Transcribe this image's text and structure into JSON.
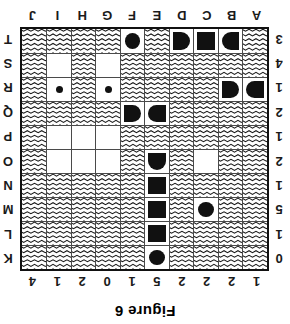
{
  "caption": "Figure 6",
  "grid": {
    "size": 10,
    "column_labels": [
      "A",
      "B",
      "C",
      "D",
      "E",
      "F",
      "G",
      "H",
      "I",
      "J"
    ],
    "row_labels": [
      "K",
      "L",
      "M",
      "N",
      "O",
      "P",
      "Q",
      "R",
      "S",
      "T"
    ],
    "column_clues": [
      "1",
      "2",
      "2",
      "2",
      "5",
      "1",
      "0",
      "2",
      "1",
      "4"
    ],
    "row_clues": [
      "0",
      "1",
      "5",
      "1",
      "2",
      "1",
      "2",
      "1",
      "4",
      "3"
    ],
    "legend": {
      "water": "zigzag-water-cell",
      "empty": "blank-unknown-cell",
      "ship": "black-ship-segment",
      "dot": "small-water-dot-marker"
    }
  },
  "cells": [
    [
      "water",
      "water",
      "water",
      "water",
      "ship-sub",
      "water",
      "water",
      "water",
      "water",
      "water"
    ],
    [
      "water",
      "water",
      "water",
      "water",
      "ship-mid-v",
      "water",
      "water",
      "water",
      "water",
      "water"
    ],
    [
      "water",
      "water",
      "ship-sub",
      "water",
      "ship-mid-v",
      "water",
      "water",
      "water",
      "water",
      "water"
    ],
    [
      "water",
      "water",
      "water",
      "water",
      "ship-mid-v",
      "water",
      "water",
      "water",
      "water",
      "water"
    ],
    [
      "water",
      "water",
      "empty",
      "water",
      "ship-end-top",
      "water",
      "empty",
      "empty",
      "empty",
      "water"
    ],
    [
      "water",
      "water",
      "water",
      "water",
      "water",
      "water",
      "empty",
      "empty",
      "empty",
      "water"
    ],
    [
      "water",
      "water",
      "water",
      "water",
      "ship-end-right",
      "ship-end-left",
      "water",
      "water",
      "water",
      "water"
    ],
    [
      "ship-end-right",
      "ship-end-left",
      "water",
      "water",
      "water",
      "water",
      "dot",
      "water",
      "dot",
      "water"
    ],
    [
      "water",
      "water",
      "water",
      "water",
      "water",
      "water",
      "empty",
      "water",
      "empty",
      "water"
    ],
    [
      "water",
      "ship-end-right",
      "ship-mid-h",
      "ship-end-left",
      "water",
      "ship-sub",
      "water",
      "water",
      "water",
      "water"
    ]
  ],
  "cell_map_note": "rows top-to-bottom K..T, columns left-to-right A..J in upright reading order"
}
